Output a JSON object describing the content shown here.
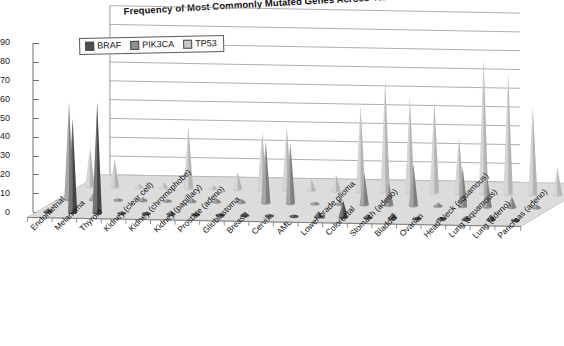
{
  "chart": {
    "title": "Frequency of Most Commonly Mutated Genes Across Various Cancer Types",
    "legend": {
      "items": [
        {
          "label": "BRAF",
          "color": "#4d4d4d"
        },
        {
          "label": "PIK3CA",
          "color": "#8f8f8f"
        },
        {
          "label": "TP53",
          "color": "#c9c9c9"
        }
      ]
    },
    "yticks": [
      "90",
      "80",
      "70",
      "60",
      "50",
      "40",
      "30",
      "20",
      "10",
      "0"
    ]
  },
  "chart_data": {
    "type": "bar",
    "render": "3d-cone-surface",
    "title": "Frequency of Most Commonly Mutated Genes Across Various Cancer Types",
    "xlabel": "",
    "ylabel": "",
    "ylim": [
      0,
      90
    ],
    "ytick_step": 10,
    "grid": true,
    "legend_position": "top-left",
    "categories": [
      "Endometrial",
      "Melanoma",
      "Thyroid",
      "Kidney (clear cell)",
      "Kidney (chromophobe)",
      "Kidney (papillary)",
      "Prostate (adeno)",
      "Glioblastoma",
      "Breast",
      "Cervix",
      "AML",
      "Lower grade glioma",
      "Colorectal",
      "Stomach (adeno)",
      "Bladder",
      "Ovarian",
      "Head-Neck (squamous)",
      "Lung (squamous)",
      "Lung (adeno)",
      "Pancreas (adeno)"
    ],
    "series": [
      {
        "name": "BRAF",
        "color": "#4d4d4d",
        "values": [
          2,
          50,
          59,
          1,
          0,
          2,
          1,
          1,
          2,
          1,
          1,
          3,
          9,
          2,
          3,
          1,
          1,
          2,
          3,
          1
        ]
      },
      {
        "name": "PIK3CA",
        "color": "#8f8f8f",
        "values": [
          52,
          4,
          1,
          2,
          1,
          2,
          2,
          2,
          33,
          32,
          1,
          2,
          17,
          12,
          22,
          2,
          21,
          16,
          6,
          2
        ]
      },
      {
        "name": "TP53",
        "color": "#c9c9c9",
        "values": [
          21,
          15,
          2,
          3,
          33,
          2,
          9,
          31,
          34,
          6,
          9,
          46,
          60,
          51,
          49,
          30,
          72,
          65,
          47,
          15
        ]
      }
    ]
  }
}
